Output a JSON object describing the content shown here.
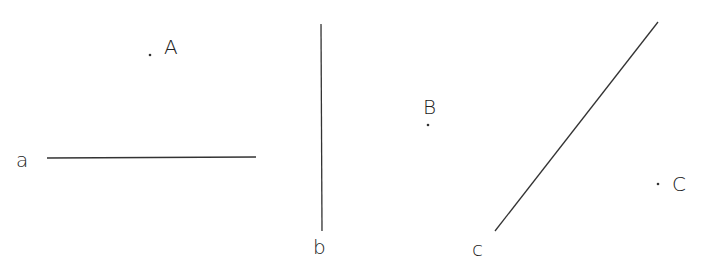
{
  "diagram": {
    "colors": {
      "stroke": "#333333",
      "text": "#222222",
      "background": "#ffffff"
    },
    "points": [
      {
        "label": "A",
        "x": 150,
        "y": 55
      },
      {
        "label": "B",
        "x": 428,
        "y": 125
      },
      {
        "label": "C",
        "x": 658,
        "y": 184
      }
    ],
    "lines": [
      {
        "label": "a",
        "x1": 47,
        "y1": 158,
        "x2": 256,
        "y2": 157,
        "orientation": "horizontal"
      },
      {
        "label": "b",
        "x1": 321,
        "y1": 24,
        "x2": 322,
        "y2": 231,
        "orientation": "vertical"
      },
      {
        "label": "c",
        "x1": 495,
        "y1": 231,
        "x2": 658,
        "y2": 22,
        "orientation": "diagonal"
      }
    ]
  }
}
